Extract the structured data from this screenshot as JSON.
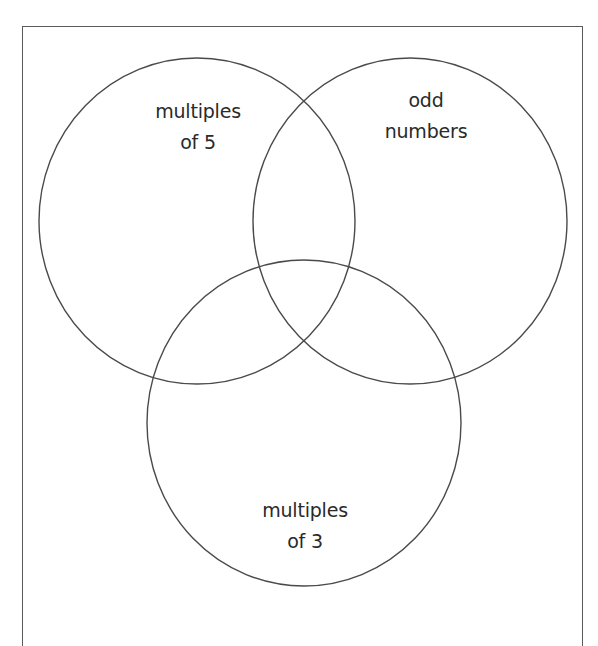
{
  "diagram": {
    "type": "venn",
    "sets": [
      {
        "id": "multiples-of-5",
        "label_line1": "multiples",
        "label_line2": "of 5",
        "position": "top-left"
      },
      {
        "id": "odd-numbers",
        "label_line1": "odd",
        "label_line2": "numbers",
        "position": "top-right"
      },
      {
        "id": "multiples-of-3",
        "label_line1": "multiples",
        "label_line2": "of 3",
        "position": "bottom"
      }
    ],
    "colors": {
      "stroke": "#4a4a4a",
      "frame": "#5a5a5a",
      "text": "#2a2a2a",
      "background": "#ffffff"
    }
  }
}
